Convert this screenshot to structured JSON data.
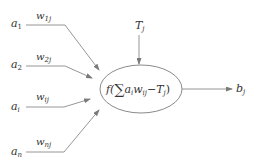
{
  "diagram": {
    "type": "neuron-model",
    "colors": {
      "line": "#8a8a8a",
      "text": "#333333",
      "background": "#ffffff"
    },
    "inputs": [
      {
        "label": "a",
        "sub": "1",
        "weight": "w",
        "weight_sub": "1j"
      },
      {
        "label": "a",
        "sub": "2",
        "weight": "w",
        "weight_sub": "2j"
      },
      {
        "label": "a",
        "sub": "i",
        "weight": "w",
        "weight_sub": "ij"
      },
      {
        "label": "a",
        "sub": "n",
        "weight": "w",
        "weight_sub": "nj"
      }
    ],
    "threshold": {
      "label": "T",
      "sub": "j"
    },
    "node": {
      "func": "f(",
      "sum": "∑",
      "a": "a",
      "a_sub": "i",
      "w": "w",
      "w_sub": "ij",
      "minus": "−",
      "T": "T",
      "T_sub": "j",
      "close": ")"
    },
    "output": {
      "label": "b",
      "sub": "j"
    }
  }
}
